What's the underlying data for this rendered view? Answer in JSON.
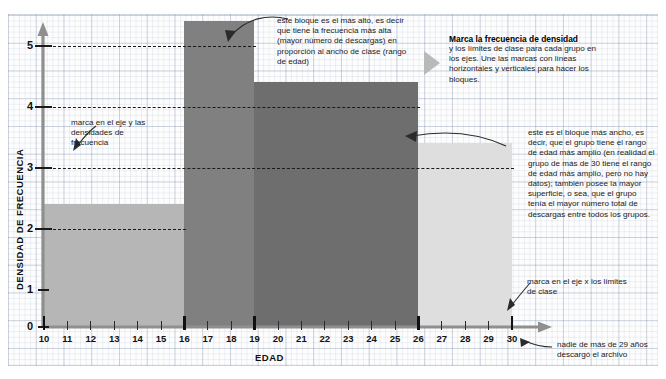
{
  "chart_data": {
    "type": "bar",
    "title": "",
    "xlabel": "EDAD",
    "ylabel": "DENSIDAD DE FRECUENCIA",
    "xlim": [
      10,
      30
    ],
    "ylim": [
      0,
      5
    ],
    "grid": true,
    "legend": "none",
    "x_ticks": [
      "10",
      "11",
      "12",
      "13",
      "14",
      "15",
      "16",
      "17",
      "18",
      "19",
      "20",
      "21",
      "22",
      "23",
      "24",
      "25",
      "26",
      "27",
      "28",
      "29",
      "30"
    ],
    "y_ticks": [
      "0",
      "1",
      "2",
      "3",
      "4",
      "5"
    ],
    "class_boundaries": [
      10,
      16,
      19,
      26,
      30
    ],
    "bars": [
      {
        "label": "10-16",
        "x_start": 10,
        "x_end": 16,
        "value": 2,
        "color": "#b6b6b6"
      },
      {
        "label": "16-19",
        "x_start": 16,
        "x_end": 19,
        "value": 5,
        "color": "#808080"
      },
      {
        "label": "19-26",
        "x_start": 19,
        "x_end": 26,
        "value": 4,
        "color": "#6e6e6e"
      },
      {
        "label": "26-30",
        "x_start": 26,
        "x_end": 30,
        "value": 3,
        "color": "#dedede"
      }
    ]
  },
  "annotations": {
    "top_block": "este bloque es el más alto, es decir que tiene la frecuencia más alta (mayor número de descargas) en proporción al ancho de clase (rango de edad)",
    "y_axis_mark": "marca en el eje y las densidades de frecuencia",
    "x_axis_mark": "marca en el eje x los límites de clase",
    "no_data_note": "nadie de más de 29 años descargó el archivo",
    "widest_block": "este es el bloque más ancho, es decir, que el grupo tiene el rango de edad más amplio (en realidad el grupo de más de 30 tiene el rango de edad más amplio, pero no hay datos); también posee la mayor superficie, o sea, que el grupo tenía el mayor número total de descargas entre todos los grupos."
  },
  "callout": {
    "title": "Marca la frecuencia de densidad",
    "body": "y los límites de clase para cada grupo en los ejes. Une las marcas con líneas horizontales y verticales para hacer los bloques.",
    "arrow_icon": "triangle-right-icon"
  },
  "colors": {
    "ink": "#1a1a1a",
    "axis": "#8a8a8a",
    "grid": "#c3cddc"
  }
}
